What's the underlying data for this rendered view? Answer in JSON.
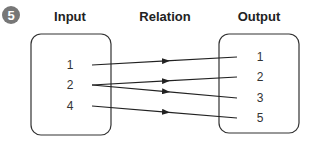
{
  "problem_number": "5",
  "headers": {
    "input": "Input",
    "relation": "Relation",
    "output": "Output"
  },
  "inputs": [
    "1",
    "2",
    "4"
  ],
  "outputs": [
    "1",
    "2",
    "3",
    "5"
  ],
  "mappings": [
    {
      "from": "1",
      "to": "1"
    },
    {
      "from": "2",
      "to": "2"
    },
    {
      "from": "2",
      "to": "3"
    },
    {
      "from": "4",
      "to": "5"
    }
  ],
  "colors": {
    "badge": "#777777",
    "line": "#222222"
  }
}
